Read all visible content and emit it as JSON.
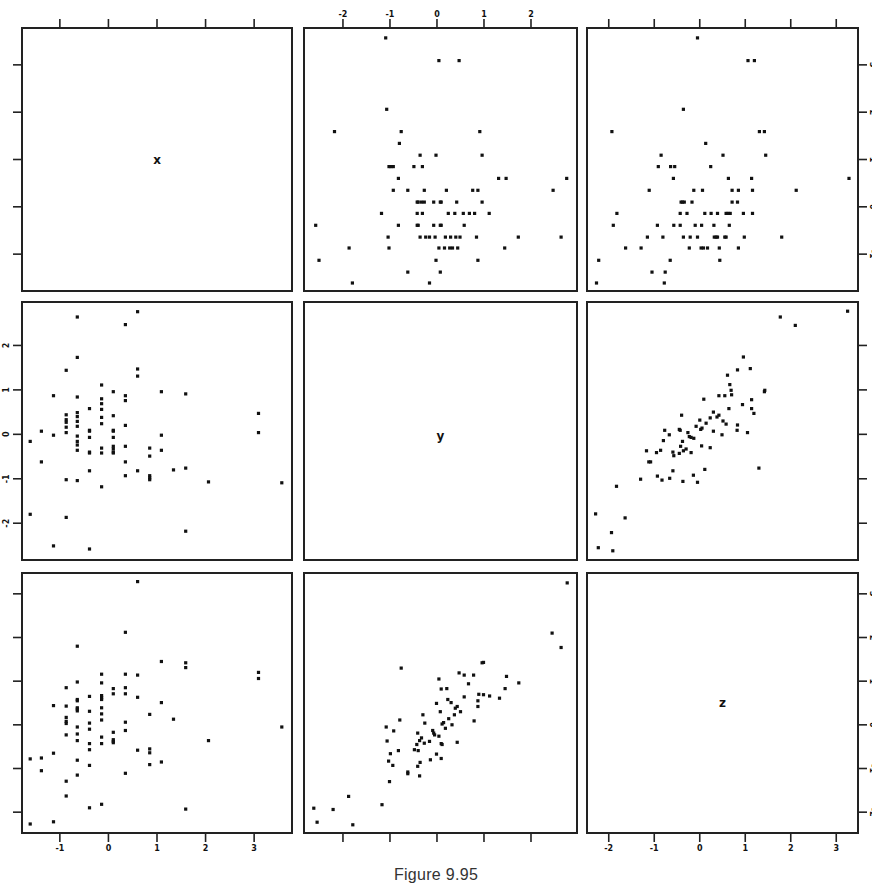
{
  "figure": {
    "caption": "Figure 9.95"
  },
  "chart_data": {
    "type": "scatter",
    "layout": "scatterplot-matrix",
    "title": "",
    "variables": [
      "x",
      "y",
      "z"
    ],
    "grid": false,
    "legend": null,
    "axes": {
      "x": {
        "range": [
          -1.8,
          3.8
        ],
        "ticks": [
          -1,
          0,
          1,
          2,
          3
        ]
      },
      "y": {
        "range": [
          -2.85,
          3.0
        ],
        "ticks": [
          -2,
          -1,
          0,
          1,
          2
        ]
      },
      "z": {
        "range": [
          -2.5,
          3.5
        ],
        "ticks": [
          -2,
          -1,
          0,
          1,
          2,
          3
        ]
      }
    },
    "tick_label_positions": {
      "top": [
        "y"
      ],
      "bottom": [
        "x",
        "z"
      ],
      "left": [
        "y"
      ],
      "right": [
        "x",
        "z"
      ]
    },
    "pairs": {
      "x_y": [
        [
          -1.61,
          -0.16
        ],
        [
          -1.61,
          -1.8
        ],
        [
          -1.38,
          0.07
        ],
        [
          -1.38,
          -0.62
        ],
        [
          -1.13,
          0.87
        ],
        [
          -1.13,
          -0.02
        ],
        [
          -1.13,
          -2.51
        ],
        [
          -0.87,
          1.44
        ],
        [
          -0.87,
          0.44
        ],
        [
          -0.87,
          0.33
        ],
        [
          -0.87,
          0.27
        ],
        [
          -0.87,
          0.16
        ],
        [
          -0.87,
          0.04
        ],
        [
          -0.87,
          -1.02
        ],
        [
          -0.87,
          -1.87
        ],
        [
          -0.64,
          2.64
        ],
        [
          -0.64,
          1.73
        ],
        [
          -0.64,
          0.84
        ],
        [
          -0.64,
          0.49
        ],
        [
          -0.64,
          0.4
        ],
        [
          -0.64,
          0.29
        ],
        [
          -0.64,
          0.18
        ],
        [
          -0.64,
          -0.04
        ],
        [
          -0.64,
          -0.16
        ],
        [
          -0.64,
          -0.24
        ],
        [
          -0.64,
          -0.36
        ],
        [
          -0.64,
          -1.04
        ],
        [
          -0.39,
          0.58
        ],
        [
          -0.39,
          0.09
        ],
        [
          -0.39,
          0.07
        ],
        [
          -0.39,
          -0.07
        ],
        [
          -0.39,
          -0.4
        ],
        [
          -0.39,
          -0.42
        ],
        [
          -0.39,
          -0.82
        ],
        [
          -0.39,
          -2.58
        ],
        [
          -0.14,
          1.11
        ],
        [
          -0.14,
          0.8
        ],
        [
          -0.14,
          0.69
        ],
        [
          -0.14,
          0.56
        ],
        [
          -0.14,
          0.38
        ],
        [
          -0.14,
          0.24
        ],
        [
          -0.14,
          -0.31
        ],
        [
          -0.14,
          -0.42
        ],
        [
          -0.14,
          -1.18
        ],
        [
          0.1,
          0.96
        ],
        [
          0.1,
          0.42
        ],
        [
          0.1,
          0.09
        ],
        [
          0.1,
          0.07
        ],
        [
          0.1,
          -0.07
        ],
        [
          0.1,
          -0.27
        ],
        [
          0.1,
          -0.33
        ],
        [
          0.1,
          -0.4
        ],
        [
          0.1,
          -0.42
        ],
        [
          0.35,
          2.47
        ],
        [
          0.35,
          0.87
        ],
        [
          0.35,
          0.76
        ],
        [
          0.35,
          0.2
        ],
        [
          0.35,
          -0.27
        ],
        [
          0.35,
          -0.62
        ],
        [
          0.35,
          -0.93
        ],
        [
          0.6,
          2.76
        ],
        [
          0.6,
          1.47
        ],
        [
          0.6,
          1.31
        ],
        [
          0.6,
          -0.82
        ],
        [
          0.85,
          -0.31
        ],
        [
          0.85,
          -0.49
        ],
        [
          0.85,
          -0.93
        ],
        [
          0.85,
          -0.98
        ],
        [
          0.85,
          -1.02
        ],
        [
          1.09,
          0.96
        ],
        [
          1.09,
          -0.02
        ],
        [
          1.09,
          -0.36
        ],
        [
          1.34,
          -0.8
        ],
        [
          1.59,
          0.91
        ],
        [
          1.59,
          -0.76
        ],
        [
          1.59,
          -2.18
        ],
        [
          2.06,
          -1.07
        ],
        [
          3.09,
          0.47
        ],
        [
          3.09,
          0.04
        ],
        [
          3.57,
          -1.09
        ]
      ],
      "x_z": [
        [
          0.6,
          3.28
        ],
        [
          0.35,
          2.12
        ],
        [
          -0.64,
          1.8
        ],
        [
          1.09,
          1.45
        ],
        [
          1.59,
          1.42
        ],
        [
          1.59,
          1.31
        ],
        [
          3.09,
          1.2
        ],
        [
          3.09,
          1.06
        ],
        [
          -0.14,
          1.16
        ],
        [
          0.35,
          1.16
        ],
        [
          0.6,
          1.14
        ],
        [
          -0.64,
          0.98
        ],
        [
          -0.14,
          0.96
        ],
        [
          -0.87,
          0.85
        ],
        [
          0.1,
          0.83
        ],
        [
          0.35,
          0.85
        ],
        [
          0.1,
          0.71
        ],
        [
          0.35,
          0.71
        ],
        [
          -0.39,
          0.65
        ],
        [
          -0.14,
          0.67
        ],
        [
          -0.14,
          0.62
        ],
        [
          -0.14,
          0.58
        ],
        [
          0.6,
          0.63
        ],
        [
          -0.64,
          0.58
        ],
        [
          -0.64,
          0.55
        ],
        [
          1.09,
          0.51
        ],
        [
          -1.13,
          0.44
        ],
        [
          -0.87,
          0.43
        ],
        [
          -0.64,
          0.39
        ],
        [
          -0.64,
          0.36
        ],
        [
          -0.64,
          0.32
        ],
        [
          -0.14,
          0.39
        ],
        [
          -0.39,
          0.31
        ],
        [
          -0.14,
          0.25
        ],
        [
          0.85,
          0.24
        ],
        [
          -0.87,
          0.17
        ],
        [
          1.34,
          0.13
        ],
        [
          -0.14,
          0.11
        ],
        [
          -0.87,
          0.08
        ],
        [
          -0.87,
          0.03
        ],
        [
          0.35,
          0.06
        ],
        [
          -0.39,
          0.04
        ],
        [
          3.57,
          -0.05
        ],
        [
          -0.64,
          -0.05
        ],
        [
          -0.39,
          -0.1
        ],
        [
          0.35,
          -0.13
        ],
        [
          0.1,
          -0.17
        ],
        [
          -0.64,
          -0.21
        ],
        [
          -0.87,
          -0.23
        ],
        [
          -0.14,
          -0.28
        ],
        [
          -0.64,
          -0.36
        ],
        [
          0.1,
          -0.34
        ],
        [
          0.1,
          -0.38
        ],
        [
          0.1,
          -0.41
        ],
        [
          2.06,
          -0.36
        ],
        [
          -0.39,
          -0.43
        ],
        [
          -0.14,
          -0.43
        ],
        [
          0.85,
          -0.55
        ],
        [
          0.85,
          -0.64
        ],
        [
          -0.39,
          -0.57
        ],
        [
          0.6,
          -0.58
        ],
        [
          -1.13,
          -0.65
        ],
        [
          -1.61,
          -0.78
        ],
        [
          -1.38,
          -0.76
        ],
        [
          -0.64,
          -0.81
        ],
        [
          1.09,
          -0.85
        ],
        [
          0.85,
          -0.91
        ],
        [
          -0.39,
          -0.93
        ],
        [
          -1.38,
          -1.05
        ],
        [
          0.35,
          -1.11
        ],
        [
          -0.64,
          -1.15
        ],
        [
          -0.87,
          -1.29
        ],
        [
          -0.87,
          -1.63
        ],
        [
          -0.14,
          -1.82
        ],
        [
          -0.39,
          -1.9
        ],
        [
          1.59,
          -1.93
        ],
        [
          -1.13,
          -2.22
        ],
        [
          -1.61,
          -2.27
        ]
      ],
      "y_z": [
        [
          2.77,
          3.25
        ],
        [
          2.45,
          2.1
        ],
        [
          2.64,
          1.77
        ],
        [
          -0.76,
          1.3
        ],
        [
          0.96,
          1.42
        ],
        [
          0.99,
          1.43
        ],
        [
          0.47,
          1.19
        ],
        [
          0.58,
          1.14
        ],
        [
          0.78,
          1.14
        ],
        [
          0.04,
          1.05
        ],
        [
          1.48,
          1.11
        ],
        [
          1.74,
          0.96
        ],
        [
          0.67,
          0.94
        ],
        [
          0.09,
          0.82
        ],
        [
          0.21,
          0.83
        ],
        [
          1.45,
          0.83
        ],
        [
          0.89,
          0.7
        ],
        [
          0.99,
          0.69
        ],
        [
          0.58,
          0.64
        ],
        [
          1.12,
          0.66
        ],
        [
          1.33,
          0.61
        ],
        [
          0.23,
          0.58
        ],
        [
          0.87,
          0.55
        ],
        [
          0.3,
          0.51
        ],
        [
          -0.01,
          0.49
        ],
        [
          0.87,
          0.42
        ],
        [
          0.43,
          0.42
        ],
        [
          0.39,
          0.38
        ],
        [
          0.07,
          0.3
        ],
        [
          0.5,
          0.3
        ],
        [
          0.37,
          0.23
        ],
        [
          -0.3,
          0.23
        ],
        [
          0.25,
          0.14
        ],
        [
          -0.79,
          0.11
        ],
        [
          0.79,
          0.09
        ],
        [
          -1.08,
          -0.05
        ],
        [
          -0.26,
          0.04
        ],
        [
          0.11,
          0.02
        ],
        [
          0.14,
          0.05
        ],
        [
          0.32,
          0.0
        ],
        [
          0.18,
          -0.08
        ],
        [
          -0.92,
          -0.14
        ],
        [
          -0.09,
          -0.13
        ],
        [
          -0.07,
          -0.19
        ],
        [
          -0.05,
          -0.23
        ],
        [
          -0.41,
          -0.19
        ],
        [
          0.04,
          -0.26
        ],
        [
          -0.33,
          -0.3
        ],
        [
          -0.37,
          -0.36
        ],
        [
          -1.06,
          -0.37
        ],
        [
          -0.27,
          -0.42
        ],
        [
          -0.16,
          -0.38
        ],
        [
          0.09,
          -0.43
        ],
        [
          0.11,
          -0.45
        ],
        [
          0.43,
          -0.4
        ],
        [
          -0.43,
          -0.45
        ],
        [
          -0.48,
          -0.57
        ],
        [
          -0.4,
          -0.59
        ],
        [
          -0.82,
          -0.59
        ],
        [
          -0.99,
          -0.66
        ],
        [
          -0.01,
          -0.67
        ],
        [
          0.09,
          -0.77
        ],
        [
          -1.03,
          -0.83
        ],
        [
          -0.14,
          -0.8
        ],
        [
          -0.36,
          -0.86
        ],
        [
          -0.94,
          -0.93
        ],
        [
          -0.41,
          -0.95
        ],
        [
          -0.62,
          -1.08
        ],
        [
          -0.62,
          -1.12
        ],
        [
          -0.37,
          -1.17
        ],
        [
          -1.01,
          -1.3
        ],
        [
          -1.88,
          -1.64
        ],
        [
          -1.17,
          -1.83
        ],
        [
          -2.62,
          -1.91
        ],
        [
          -2.21,
          -1.94
        ],
        [
          -2.55,
          -2.23
        ],
        [
          -1.79,
          -2.29
        ]
      ]
    }
  }
}
